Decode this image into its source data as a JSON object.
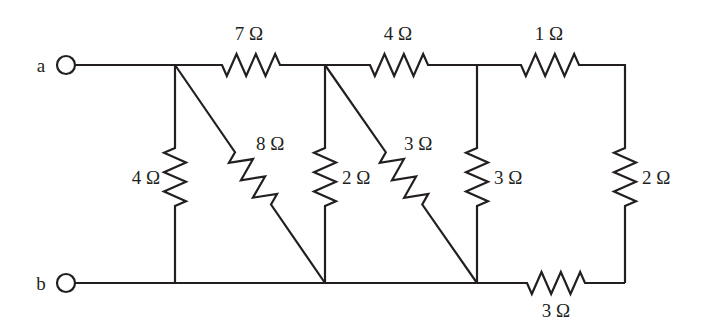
{
  "figure": {
    "type": "resistor-network-schematic",
    "width": 708,
    "height": 333,
    "background_color": "#ffffff",
    "line_color": "#231f20"
  },
  "terminals": [
    {
      "id": "a",
      "label": "a",
      "label_x": 41,
      "label_y": 72,
      "cx": 66,
      "cy": 65,
      "r": 9
    },
    {
      "id": "b",
      "label": "b",
      "label_x": 41,
      "label_y": 290,
      "cx": 66,
      "cy": 283,
      "r": 9
    }
  ],
  "rails": {
    "top_y": 65,
    "bottom_y": 283,
    "left_x": 75,
    "right_x": 625
  },
  "nodes": [
    {
      "id": "n1-top",
      "x": 175,
      "y": 65
    },
    {
      "id": "n2-top",
      "x": 325,
      "y": 65
    },
    {
      "id": "n3-top",
      "x": 477,
      "y": 65
    },
    {
      "id": "n4-top",
      "x": 625,
      "y": 65
    },
    {
      "id": "n1-bot",
      "x": 175,
      "y": 283
    },
    {
      "id": "n2-bot",
      "x": 325,
      "y": 283
    },
    {
      "id": "n3-bot",
      "x": 477,
      "y": 283
    },
    {
      "id": "n4-bot",
      "x": 625,
      "y": 283
    }
  ],
  "resistors": [
    {
      "id": "r-7ohm",
      "value": "7",
      "unit": "Ω",
      "label": "7 Ω",
      "orientation": "horizontal",
      "from": [
        175,
        65
      ],
      "to": [
        325,
        65
      ],
      "body_start": 222,
      "body_end": 280,
      "amplitude": 11,
      "label_x": 249,
      "label_y": 40,
      "label_anchor": "middle"
    },
    {
      "id": "r-4ohm-top",
      "value": "4",
      "unit": "Ω",
      "label": "4 Ω",
      "orientation": "horizontal",
      "from": [
        325,
        65
      ],
      "to": [
        477,
        65
      ],
      "body_start": 370,
      "body_end": 428,
      "amplitude": 11,
      "label_x": 398,
      "label_y": 40,
      "label_anchor": "middle"
    },
    {
      "id": "r-1ohm",
      "value": "1",
      "unit": "Ω",
      "label": "1 Ω",
      "orientation": "horizontal",
      "from": [
        477,
        65
      ],
      "to": [
        625,
        65
      ],
      "body_start": 521,
      "body_end": 579,
      "amplitude": 11,
      "label_x": 549,
      "label_y": 40,
      "label_anchor": "middle"
    },
    {
      "id": "r-3ohm-bottom",
      "value": "3",
      "unit": "Ω",
      "label": "3 Ω",
      "orientation": "horizontal",
      "from": [
        477,
        283
      ],
      "to": [
        625,
        283
      ],
      "body_start": 527,
      "body_end": 585,
      "amplitude": 11,
      "label_x": 556,
      "label_y": 317,
      "label_anchor": "middle"
    },
    {
      "id": "r-4ohm-left",
      "value": "4",
      "unit": "Ω",
      "label": "4 Ω",
      "orientation": "vertical",
      "from": [
        175,
        65
      ],
      "to": [
        175,
        283
      ],
      "body_start": 148,
      "body_end": 206,
      "amplitude": 11,
      "label_x": 160,
      "label_y": 184,
      "label_anchor": "end"
    },
    {
      "id": "r-2ohm-mid",
      "value": "2",
      "unit": "Ω",
      "label": "2 Ω",
      "orientation": "vertical",
      "from": [
        325,
        65
      ],
      "to": [
        325,
        283
      ],
      "body_start": 148,
      "body_end": 206,
      "amplitude": 11,
      "label_x": 342,
      "label_y": 184,
      "label_anchor": "start"
    },
    {
      "id": "r-3ohm-mid",
      "value": "3",
      "unit": "Ω",
      "label": "3 Ω",
      "orientation": "vertical",
      "from": [
        477,
        65
      ],
      "to": [
        477,
        283
      ],
      "body_start": 148,
      "body_end": 206,
      "amplitude": 11,
      "label_x": 494,
      "label_y": 184,
      "label_anchor": "start"
    },
    {
      "id": "r-2ohm-right",
      "value": "2",
      "unit": "Ω",
      "label": "2 Ω",
      "orientation": "vertical",
      "from": [
        625,
        65
      ],
      "to": [
        625,
        283
      ],
      "body_start": 148,
      "body_end": 206,
      "amplitude": 11,
      "label_x": 642,
      "label_y": 184,
      "label_anchor": "start"
    },
    {
      "id": "r-8ohm-diagonal",
      "value": "8",
      "unit": "Ω",
      "label": "8 Ω",
      "orientation": "diagonal",
      "from": [
        175,
        65
      ],
      "to": [
        325,
        283
      ],
      "body_t_start": 0.4,
      "body_t_end": 0.64,
      "amplitude": 11,
      "label_x": 256,
      "label_y": 150,
      "label_anchor": "start"
    },
    {
      "id": "r-3ohm-diagonal",
      "value": "3",
      "unit": "Ω",
      "label": "3 Ω",
      "orientation": "diagonal",
      "from": [
        325,
        65
      ],
      "to": [
        477,
        283
      ],
      "body_t_start": 0.4,
      "body_t_end": 0.64,
      "amplitude": 11,
      "label_x": 404,
      "label_y": 150,
      "label_anchor": "start"
    }
  ]
}
